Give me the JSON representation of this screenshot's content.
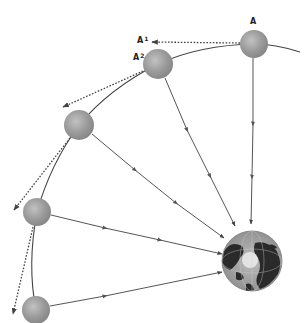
{
  "diagram": {
    "labels": {
      "A": "A",
      "A1_base": "A",
      "A1_sup": "1",
      "A2_base": "A",
      "A2_sup": "2"
    },
    "colors": {
      "background": "#ffffff",
      "sphere": "#9a9a9a",
      "sphere_highlight": "#c4c4c4",
      "sphere_shadow": "#7e7e7e",
      "line": "#555555",
      "earth_ocean": "#a8a8a8",
      "earth_land": "#2a2a2a",
      "earth_ice": "#e8e8e8"
    },
    "nodes": [
      {
        "id": "A",
        "cx": 254,
        "cy": 44,
        "r": 14,
        "label": "A"
      },
      {
        "id": "A2",
        "cx": 158,
        "cy": 64,
        "r": 15,
        "label": "A2"
      },
      {
        "id": "P3",
        "cx": 79,
        "cy": 125,
        "r": 15
      },
      {
        "id": "P4",
        "cx": 37,
        "cy": 212,
        "r": 14
      },
      {
        "id": "P5",
        "cx": 36,
        "cy": 310,
        "r": 14
      }
    ],
    "earth": {
      "cx": 252,
      "cy": 261,
      "r": 30,
      "name": "Earth"
    }
  }
}
